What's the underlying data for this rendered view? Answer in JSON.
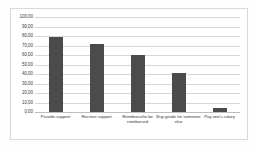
{
  "chart_data": {
    "type": "bar",
    "title": "",
    "xlabel": "",
    "ylabel": "",
    "categories": [
      "Provide support",
      "Receive support",
      "Reimburse/to be reimbursed",
      "Buy goods for someone else",
      "Pay one's salary"
    ],
    "values": [
      79.0,
      71.5,
      59.5,
      41.5,
      4.0
    ],
    "ylim": [
      0,
      100
    ],
    "ytick_step": 10,
    "ytick_labels": [
      "100,00",
      "90,00",
      "80,00",
      "70,00",
      "60,00",
      "50,00",
      "40,00",
      "30,00",
      "20,00",
      "10,00",
      "0,00"
    ],
    "ytick_values": [
      100,
      90,
      80,
      70,
      60,
      50,
      40,
      30,
      20,
      10,
      0
    ],
    "grid": true,
    "legend": "none",
    "decimal_separator": ",",
    "series": [
      {
        "name": "",
        "color": "#4b4b4b",
        "values": [
          79.0,
          71.5,
          59.5,
          41.5,
          4.0
        ]
      }
    ]
  },
  "colors": {
    "bar": "#4b4b4b",
    "gridline": "#d7d7d7",
    "baseline": "#bdbdbd",
    "frame": "#d9d9d9",
    "text": "#3d3d3d",
    "background": "#ffffff"
  }
}
